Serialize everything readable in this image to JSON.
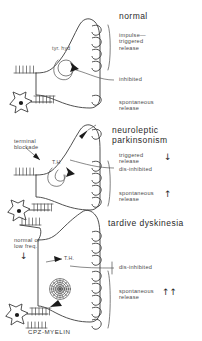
{
  "figure": {
    "name": "dopamine-terminal-diagram",
    "caption": "CPZ-MYELIN",
    "panels": [
      {
        "id": "normal",
        "title": "normal",
        "left_labels": [
          {
            "name": "tyrosine-hydroxylase-label",
            "text": "tyr. hyd"
          }
        ],
        "right_labels": [
          {
            "name": "impulse-triggered-release-label",
            "text": "impulse—\ntriggered\nrelease",
            "arrows": ""
          },
          {
            "name": "inhibited-label",
            "text": "inhibited",
            "arrows": ""
          },
          {
            "name": "spontaneous-release-label",
            "text": "spontaneous\nrelease",
            "arrows": ""
          }
        ],
        "vesicles_triggered": 4,
        "vesicles_spontaneous": 1
      },
      {
        "id": "neuroleptic-parkinsonism",
        "title": "neuroleptic\nparkinsonism",
        "left_labels": [
          {
            "name": "terminal-blockade-label",
            "text": "terminal\nblockade"
          },
          {
            "name": "tyrosine-hydroxylase-label",
            "text": "T.H"
          }
        ],
        "right_labels": [
          {
            "name": "triggered-release-label",
            "text": "triggered\nrelease",
            "arrows": "down"
          },
          {
            "name": "dis-inhibited-label",
            "text": "dis-inhibited",
            "arrows": ""
          },
          {
            "name": "spontaneous-release-label",
            "text": "spontaneous\nrelease",
            "arrows": "up"
          }
        ],
        "vesicles_triggered": 1,
        "vesicles_spontaneous": 4
      },
      {
        "id": "tardive-dyskinesia",
        "title": "tardive dyskinesia",
        "left_labels": [
          {
            "name": "normal-or-low-freq-label",
            "text": "normal or\nlow freq."
          },
          {
            "name": "tyrosine-hydroxylase-label",
            "text": "T.H."
          }
        ],
        "right_labels": [
          {
            "name": "dis-inhibited-label",
            "text": "dis-inhibited",
            "arrows": ""
          },
          {
            "name": "spontaneous-release-label",
            "text": "spontaneous\nrelease",
            "arrows": "up-up"
          }
        ],
        "vesicles_triggered": 3,
        "vesicles_spontaneous": 5
      }
    ],
    "glyphs": {
      "arrow_down": "↓",
      "arrow_up": "↑",
      "arrow_up_double": "↑↑"
    },
    "colors": {
      "ink": "#3c3c3c",
      "background": "#ffffff",
      "nucleus": "#1a1a1a"
    }
  }
}
